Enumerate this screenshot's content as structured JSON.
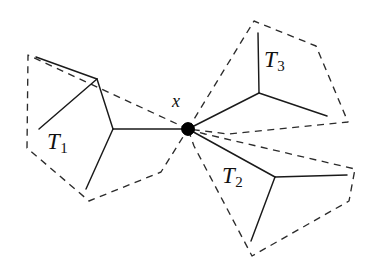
{
  "figure": {
    "type": "graph-diagram",
    "background_color": "#ffffff",
    "stroke_color": "#1a1a1a",
    "boundary_color": "#2b2b2b",
    "vertex_color": "#000000",
    "labels": {
      "center_vertex": "x",
      "subtree_1_base": "T",
      "subtree_1_index": "1",
      "subtree_2_base": "T",
      "subtree_2_index": "2",
      "subtree_3_base": "T",
      "subtree_3_index": "3"
    },
    "label_positions": {
      "center_vertex": {
        "x": 172,
        "y": 92
      },
      "subtree_1": {
        "x": 47,
        "y": 130
      },
      "subtree_2": {
        "x": 222,
        "y": 164
      },
      "subtree_3": {
        "x": 264,
        "y": 48
      }
    },
    "center_vertex": {
      "x": 188,
      "y": 129,
      "radius": 6.2
    },
    "tree_edges": [
      {
        "name": "t1-leaf-upper-to-branch",
        "points": "36,57 97,79"
      },
      {
        "name": "t1-branch-to-leaf-left",
        "points": "97,79 39,129"
      },
      {
        "name": "t1-branch-to-node",
        "points": "97,79 113,129"
      },
      {
        "name": "t1-node-to-leaf-lower",
        "points": "113,129 86,189"
      },
      {
        "name": "t1-node-to-center",
        "points": "113,129 188,129"
      },
      {
        "name": "t3-center-edge",
        "points": "188,129 259,93"
      },
      {
        "name": "t3-node-to-top-leaf",
        "points": "259,93 258,33"
      },
      {
        "name": "t3-node-to-right-leaf",
        "points": "259,93 327,116"
      },
      {
        "name": "t2-center-edge",
        "points": "188,129 275,177"
      },
      {
        "name": "t2-node-to-right-leaf",
        "points": "275,177 347,175"
      },
      {
        "name": "t2-node-to-bottom-leaf",
        "points": "275,177 251,241"
      }
    ],
    "region_boundaries": [
      {
        "name": "t1-region",
        "label": "T1",
        "points": "188,129 28,55 27,148 89,201 161,172 188,129"
      },
      {
        "name": "t3-region",
        "label": "T3",
        "points": "188,129 254,21 316,46 348,122 228,134 188,129"
      },
      {
        "name": "t2-region",
        "label": "T2",
        "points": "188,129 205,134 355,169 349,201 252,256 194,146 188,129"
      }
    ]
  }
}
